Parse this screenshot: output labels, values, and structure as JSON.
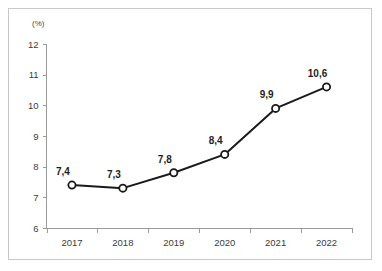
{
  "chart_data": {
    "type": "line",
    "title": "",
    "subtitle": "",
    "xlabel": "",
    "ylabel": "",
    "unit_label": "(%)",
    "categories": [
      "2017",
      "2018",
      "2019",
      "2020",
      "2021",
      "2022"
    ],
    "values": [
      7.4,
      7.3,
      7.8,
      8.4,
      9.9,
      10.6
    ],
    "point_labels": [
      "7,4",
      "7,3",
      "7,8",
      "8,4",
      "9,9",
      "10,6"
    ],
    "ylim": [
      6,
      12
    ],
    "ytick_labels": [
      "12",
      "11",
      "10",
      "9",
      "8",
      "7",
      "6"
    ],
    "ytick_values": [
      12,
      11,
      10,
      9,
      8,
      7,
      6
    ],
    "grid": false,
    "legend": false,
    "legend_position": "none",
    "marker": "open-circle",
    "decimal_separator": ",",
    "colors": {
      "line": "#1a1a1a",
      "marker_fill": "#ffffff",
      "marker_stroke": "#1a1a1a",
      "axis": "#9a9a9a",
      "tick_text": "#3c3c3c",
      "label_text": "#1e1e1e",
      "frame_border": "#c9c9c9",
      "background": "#ffffff"
    }
  }
}
